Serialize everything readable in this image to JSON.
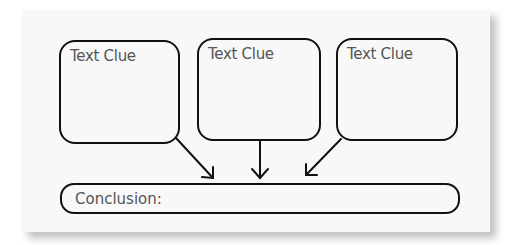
{
  "diagram": {
    "clue_boxes": [
      {
        "label": "Text Clue"
      },
      {
        "label": "Text Clue"
      },
      {
        "label": "Text Clue"
      }
    ],
    "conclusion": {
      "label": "Conclusion:"
    },
    "arrows": [
      {
        "from": "clue_box_1",
        "to": "conclusion",
        "icon": "arrow-down-right-icon"
      },
      {
        "from": "clue_box_2",
        "to": "conclusion",
        "icon": "arrow-down-icon"
      },
      {
        "from": "clue_box_3",
        "to": "conclusion",
        "icon": "arrow-down-left-icon"
      }
    ],
    "colors": {
      "stroke": "#111111",
      "text": "#555555",
      "paper": "#f8f8f8"
    }
  }
}
